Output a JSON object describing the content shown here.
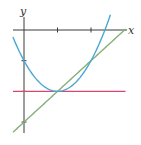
{
  "chart_data": {
    "type": "line",
    "title": "",
    "xlabel": "x",
    "ylabel": "y",
    "xlim": [
      -0.35,
      3.1
    ],
    "ylim": [
      -3.4,
      0.55
    ],
    "x_ticks": [
      1,
      2
    ],
    "y_ticks": [
      -1,
      -2,
      -3
    ],
    "tick_labels_shown": false,
    "grid": false,
    "legend": "none",
    "series": [
      {
        "name": "parabola",
        "equation": "y = (x - 1)^2 - 2",
        "color": "#4aa8d2",
        "x_range": [
          -0.33,
          2.58
        ]
      },
      {
        "name": "line",
        "equation": "y = x - 3",
        "color": "#86b07a",
        "x_range": [
          -0.33,
          3.03
        ]
      },
      {
        "name": "horizontal-line",
        "equation": "y = -2",
        "color": "#d9456e",
        "x_range": [
          -0.33,
          3.03
        ]
      }
    ],
    "points_of_interest": [
      {
        "label": "vertex-tangent-point",
        "x": 1,
        "y": -2
      },
      {
        "label": "intersection",
        "x": 2,
        "y": -1
      }
    ]
  }
}
